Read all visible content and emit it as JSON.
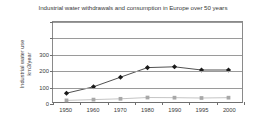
{
  "chart_data": {
    "type": "line",
    "title": "Industrial water withdrawals and consumption in Europe over 50 years",
    "xlabel": "",
    "ylabel_line1": "Industrial water use",
    "ylabel_line2": "km3/year",
    "categories": [
      "1950",
      "1960",
      "1970",
      "1980",
      "1990",
      "1995",
      "2000"
    ],
    "ylim": [
      0,
      500
    ],
    "yticks": [
      0,
      100,
      200,
      300,
      400,
      500
    ],
    "ytick_labels": [
      "0",
      "100",
      "200",
      "300",
      "",
      ""
    ],
    "grid": true,
    "legend": "none",
    "series": [
      {
        "name": "Water withdrawals",
        "marker": "diamond",
        "color": "#1a1a1a",
        "line_color": "#3a3a3a",
        "values": [
          55,
          95,
          155,
          215,
          220,
          200,
          200
        ]
      },
      {
        "name": "Water consumption",
        "marker": "square",
        "color": "#a8a8a8",
        "line_color": "#bcbcbc",
        "values": [
          10,
          15,
          20,
          28,
          27,
          25,
          27
        ]
      }
    ]
  }
}
